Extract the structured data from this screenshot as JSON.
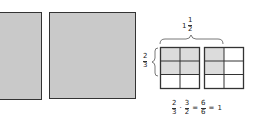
{
  "figure": {
    "squares": [
      {
        "id": "square-1",
        "fill": "#c9c9c9"
      },
      {
        "id": "square-2",
        "fill": "#c9c9c9"
      }
    ],
    "width_label": {
      "whole": "1",
      "numerator": "1",
      "denominator": "2"
    },
    "height_label": {
      "numerator": "2",
      "denominator": "3"
    },
    "grids": [
      {
        "cols": 2,
        "rows": 3,
        "shaded": [
          [
            1,
            1
          ],
          [
            1,
            1
          ],
          [
            0,
            0
          ]
        ]
      },
      {
        "cols": 2,
        "rows": 3,
        "shaded": [
          [
            1,
            0
          ],
          [
            1,
            0
          ],
          [
            0,
            0
          ]
        ]
      }
    ],
    "colors": {
      "shade": "#dcdcdc",
      "line": "#333333",
      "square_fill": "#c9c9c9"
    },
    "equation": {
      "f1": {
        "numerator": "2",
        "denominator": "3"
      },
      "op1": "·",
      "f2": {
        "numerator": "3",
        "denominator": "2"
      },
      "eq1": "=",
      "f3": {
        "numerator": "6",
        "denominator": "6"
      },
      "eq2": "=",
      "result": "1"
    }
  }
}
